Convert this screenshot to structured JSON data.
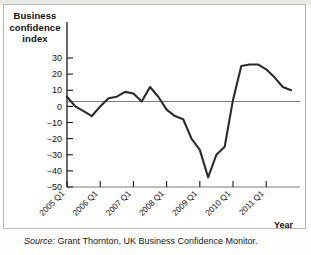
{
  "figure": {
    "title": "Business confidence index",
    "title_lines": [
      "Business",
      "confidence",
      "index"
    ],
    "xlabel": "Year",
    "source": "Source: Grant Thornton, UK Business Confidence Monitor.",
    "source_prefix": "Source:",
    "source_rest": " Grant Thornton, UK Business Confidence Monitor.",
    "line_color": "#2b2b2b",
    "axis_color": "#1a1a1a",
    "zero_line_color": "#7d7d7d"
  },
  "chart_data": {
    "type": "line",
    "title": "Business confidence index",
    "xlabel": "Year",
    "ylabel": "Business confidence index",
    "ylim": [
      -50,
      30
    ],
    "yticks": [
      30,
      20,
      10,
      0,
      -10,
      -20,
      -30,
      -40,
      -50
    ],
    "ytick_labels": [
      "30",
      "20",
      "10",
      "0",
      "−10",
      "−20",
      "−30",
      "−40",
      "−50"
    ],
    "xticks": [
      "2005 Q1",
      "2006 Q1",
      "2007 Q1",
      "2008 Q1",
      "2009 Q1",
      "2010 Q1",
      "2011 Q1"
    ],
    "grid": false,
    "legend": "none",
    "zero_reference_line": 0,
    "x": [
      "2005 Q1",
      "2005 Q2",
      "2005 Q3",
      "2005 Q4",
      "2006 Q1",
      "2006 Q2",
      "2006 Q3",
      "2006 Q4",
      "2007 Q1",
      "2007 Q2",
      "2007 Q3",
      "2007 Q4",
      "2008 Q1",
      "2008 Q2",
      "2008 Q3",
      "2008 Q4",
      "2009 Q1",
      "2009 Q2",
      "2009 Q3",
      "2009 Q4",
      "2010 Q1",
      "2010 Q2",
      "2010 Q3",
      "2010 Q4",
      "2011 Q1",
      "2011 Q2",
      "2011 Q3",
      "2011 Q4"
    ],
    "values": [
      6,
      0,
      -3,
      -6,
      0,
      5,
      6,
      9,
      8,
      3,
      12,
      6,
      -2,
      -6,
      -8,
      -20,
      -27,
      -44,
      -30,
      -25,
      4,
      25,
      26,
      26,
      23,
      18,
      12,
      10
    ],
    "series": [
      {
        "name": "UK business confidence index",
        "values": [
          6,
          0,
          -3,
          -6,
          0,
          5,
          6,
          9,
          8,
          3,
          12,
          6,
          -2,
          -6,
          -8,
          -20,
          -27,
          -44,
          -30,
          -25,
          4,
          25,
          26,
          26,
          23,
          18,
          12,
          10
        ]
      }
    ],
    "annotations": {
      "trough": {
        "x": "2009 Q1",
        "y": -44
      },
      "peak": {
        "x": "2010 Q3",
        "y": 26
      },
      "final": {
        "x": "2011 Q4",
        "y": -11
      }
    }
  }
}
